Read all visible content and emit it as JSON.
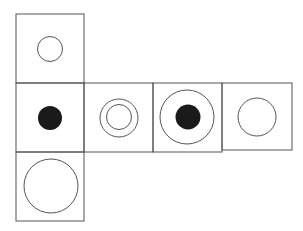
{
  "diagram": {
    "type": "cube-net",
    "stroke_color": "#555555",
    "fill_color": "#1a1a1a",
    "faces": [
      {
        "id": "top",
        "row": 0,
        "col": 0,
        "symbol": "small-circle"
      },
      {
        "id": "left",
        "row": 1,
        "col": 0,
        "symbol": "filled-dot"
      },
      {
        "id": "front",
        "row": 1,
        "col": 1,
        "symbol": "double-circle"
      },
      {
        "id": "right",
        "row": 1,
        "col": 2,
        "symbol": "circle-with-filled-dot"
      },
      {
        "id": "back",
        "row": 1,
        "col": 3,
        "symbol": "medium-circle"
      },
      {
        "id": "bottom",
        "row": 2,
        "col": 0,
        "symbol": "large-circle"
      }
    ]
  }
}
